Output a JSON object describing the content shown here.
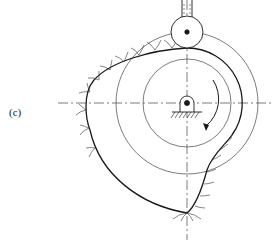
{
  "figure": {
    "label": "(c)",
    "colors": {
      "line": "#1a1a1a",
      "thin": "#444444",
      "background": "#ffffff"
    }
  }
}
